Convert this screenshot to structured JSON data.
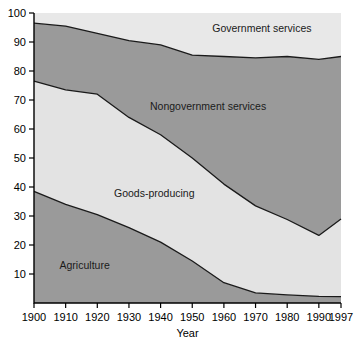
{
  "chart_data": {
    "type": "area",
    "title": "",
    "subtitle": "",
    "xlabel": "Year",
    "ylabel": "",
    "stacked": true,
    "grid": false,
    "legend_position": "inline-labels",
    "x": [
      1900,
      1910,
      1920,
      1930,
      1940,
      1950,
      1960,
      1970,
      1980,
      1990,
      1997
    ],
    "xlim": [
      1900,
      1997
    ],
    "ylim": [
      0,
      100
    ],
    "xticks": [
      "1900",
      "1910",
      "1920",
      "1930",
      "1940",
      "1950",
      "1960",
      "1970",
      "1980",
      "1990",
      "1997"
    ],
    "yticks": [
      "10",
      "20",
      "30",
      "40",
      "50",
      "60",
      "70",
      "80",
      "90",
      "100"
    ],
    "series": [
      {
        "name": "Agriculture",
        "color": "#9a9a9a",
        "values": [
          38.5,
          34.0,
          30.5,
          26.0,
          21.0,
          14.5,
          7.0,
          3.5,
          2.8,
          2.3,
          2.2
        ]
      },
      {
        "name": "Goods-producing",
        "color": "#e3e3e3",
        "values": [
          38.0,
          39.5,
          41.5,
          38.0,
          37.0,
          35.5,
          34.0,
          30.0,
          26.0,
          21.0,
          26.8
        ]
      },
      {
        "name": "Nongovernment services",
        "color": "#9a9a9a",
        "values": [
          20.0,
          22.0,
          21.0,
          26.5,
          31.0,
          35.5,
          44.0,
          51.0,
          56.2,
          60.7,
          56.0
        ]
      },
      {
        "name": "Government services",
        "color": "#e8e8e8",
        "values": [
          3.5,
          4.5,
          7.0,
          9.5,
          11.0,
          14.5,
          15.0,
          15.5,
          15.0,
          16.0,
          15.0
        ]
      }
    ],
    "cumulative_boundaries": {
      "agriculture_top": [
        38.5,
        34.0,
        30.5,
        26.0,
        21.0,
        14.5,
        7.0,
        3.5,
        2.8,
        2.3,
        2.2
      ],
      "goods_top": [
        76.5,
        73.5,
        72.0,
        64.0,
        58.0,
        50.0,
        41.0,
        33.5,
        28.8,
        23.3,
        29.0
      ],
      "nongov_top": [
        96.5,
        95.5,
        93.0,
        90.5,
        89.0,
        85.5,
        85.0,
        84.5,
        85.0,
        84.0,
        85.0
      ],
      "total": [
        100,
        100,
        100,
        100,
        100,
        100,
        100,
        100,
        100,
        100,
        100
      ]
    },
    "band_labels": [
      {
        "text": "Government services",
        "x": 1972,
        "y": 95
      },
      {
        "text": "Nongovernment services",
        "x": 1955,
        "y": 68
      },
      {
        "text": "Goods-producing",
        "x": 1938,
        "y": 38
      },
      {
        "text": "Agriculture",
        "x": 1916,
        "y": 13
      }
    ]
  },
  "axis": {
    "x_title": "Year"
  }
}
